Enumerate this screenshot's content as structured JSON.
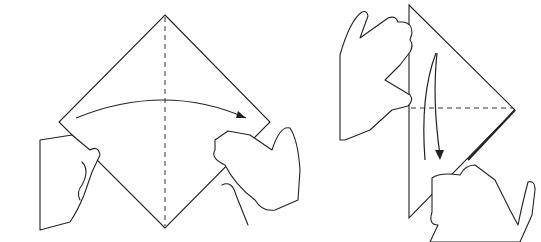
{
  "figure": {
    "type": "origami-instruction-illustration",
    "steps": [
      {
        "id": "step-1",
        "action": "fold diamond in half, left corner to right corner",
        "fold_line": "vertical-dashed",
        "arrow": "left-to-right"
      },
      {
        "id": "step-2",
        "action": "fold top corner down to bottom corner",
        "fold_line": "horizontal-dashed",
        "arrow": "top-to-bottom"
      }
    ],
    "colors": {
      "line": "#222222",
      "background": "#ffffff"
    }
  }
}
